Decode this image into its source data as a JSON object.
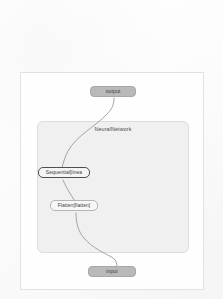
{
  "diagram": {
    "type": "computation-graph",
    "module_panel": {
      "label": "NeuralNetwork"
    },
    "nodes": [
      {
        "id": "output",
        "label": "output",
        "kind": "io"
      },
      {
        "id": "sequential",
        "label": "Sequential[linea",
        "kind": "op",
        "selected": true
      },
      {
        "id": "flatten",
        "label": "Flatten[flatten]",
        "kind": "op",
        "selected": false
      },
      {
        "id": "input",
        "label": "input",
        "kind": "io"
      }
    ],
    "edges": [
      {
        "from": "output",
        "to": "sequential"
      },
      {
        "from": "sequential",
        "to": "flatten"
      },
      {
        "from": "flatten",
        "to": "input"
      }
    ],
    "colors": {
      "page_background": "#fdfdfd",
      "card_background": "#fefefe",
      "card_border": "#e2e2e2",
      "module_panel_fill": "#f0f0f0",
      "module_panel_border": "#dcdcdc",
      "io_node_fill": "#b9b9b9",
      "op_node_fill": "#f7f7f7",
      "op_node_border": "#b4b4b4",
      "selected_node_border": "#4f4f4f",
      "edge_stroke": "#9a9a9a"
    }
  }
}
